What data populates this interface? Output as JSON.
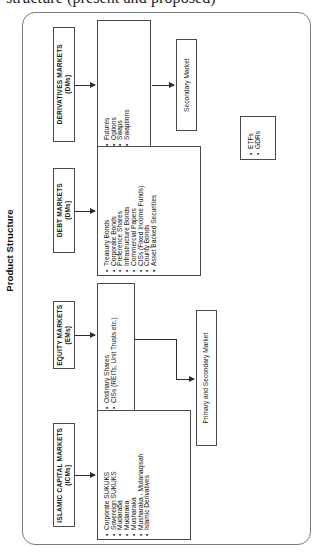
{
  "caption": "structure (present and proposed)",
  "page_title": "Product Structure",
  "diagram": {
    "title": "Product Structure",
    "type": "flow-diagram",
    "orientation": "rotated-90-ccw",
    "branches": [
      {
        "id": "derivatives",
        "category": "DERIVATIVES MARKETS",
        "abbreviation": "(DMs)",
        "instruments": [
          "Futures",
          "Options",
          "Swaps",
          "Swaptions"
        ],
        "outcome": "Secondary Market"
      },
      {
        "id": "debt",
        "category": "DEBT MARKETS",
        "abbreviation": "(DMs)",
        "instruments": [
          "Treasury Bonds",
          "Corporate Bonds",
          "Preference Shares",
          "Infrastructure Bonds",
          "Commercial Papers",
          "CISs (Fixed Income Funds)",
          "County Bonds",
          "Asset Backed Securities"
        ],
        "outcome": ""
      },
      {
        "id": "equity",
        "category": "EQUITY MARKETS",
        "abbreviation": "(EMs)",
        "instruments": [
          "Ordinary Shares",
          "CISs (REITs, Unit Trusts etc.)"
        ],
        "outcome": "Primary and Secondary Market"
      },
      {
        "id": "islamic",
        "category": "ISLAMIC CAPITAL MARKETS",
        "abbreviation": "(ICMs)",
        "instruments": [
          "Corporate SUKUKS",
          "Sovereign SUKUKS",
          "Mudaraba",
          "Mudaraka",
          "Musharaka",
          "Musharaka - Mutanaqisah",
          "Islamic Derivatives"
        ],
        "outcome": ""
      }
    ],
    "side_box": {
      "id": "etf-gdr",
      "items": [
        "ETFs",
        "GDRs"
      ]
    },
    "outcomes": {
      "secondary_market": "Secondary Market",
      "primary_and_secondary_market": "Primary and Secondary Market"
    }
  },
  "colors": {
    "border": "#4a4a4a",
    "frame_border": "#7c7c7c",
    "text": "#121212",
    "background": "#ffffff",
    "arrow": "#2c2c2c"
  }
}
